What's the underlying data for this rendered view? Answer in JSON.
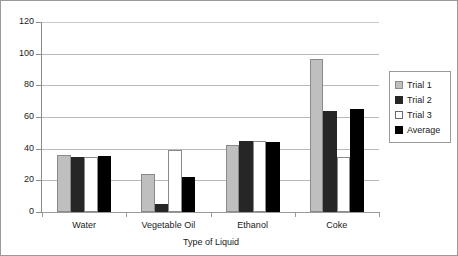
{
  "chart_data": {
    "type": "bar",
    "title": "",
    "xlabel": "Type of Liquid",
    "ylabel": "",
    "categories": [
      "Water",
      "Vegetable Oil",
      "Ethanol",
      "Coke"
    ],
    "series": [
      {
        "name": "Trial 1",
        "color": "#bfbfbf",
        "values": [
          36,
          24,
          42.5,
          96.5
        ]
      },
      {
        "name": "Trial 2",
        "color": "#262626",
        "values": [
          35,
          5,
          45,
          63.5
        ]
      },
      {
        "name": "Trial 3",
        "color": "#ffffff",
        "values": [
          35,
          39,
          45,
          35
        ]
      },
      {
        "name": "Average",
        "color": "#000000",
        "values": [
          35.5,
          22,
          44,
          65
        ]
      }
    ],
    "ylim": [
      0,
      120
    ],
    "ytick_step": 20,
    "yticks": [
      "0",
      "20",
      "40",
      "60",
      "80",
      "100",
      "120"
    ],
    "grid": true,
    "legend_position": "right"
  },
  "legend": {
    "items": [
      {
        "label": "Trial 1"
      },
      {
        "label": "Trial 2"
      },
      {
        "label": "Trial 3"
      },
      {
        "label": "Average"
      }
    ]
  }
}
